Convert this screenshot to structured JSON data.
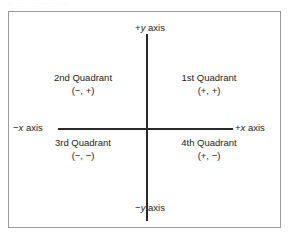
{
  "caption_strip": {
    "text": "·· ··· ·· ····· ···· ···"
  },
  "figure": {
    "border_color": "#9a9a9a",
    "axis_color": "#2a2a2a",
    "text_color": "#1d1d1d",
    "background": "#ffffff"
  },
  "axes": {
    "positive_y": {
      "sign": "+",
      "variable": "y",
      "suffix": " axis"
    },
    "negative_y": {
      "sign": "−",
      "variable": "y",
      "suffix": " axis"
    },
    "positive_x": {
      "sign": "+",
      "variable": "x",
      "suffix": " axis"
    },
    "negative_x": {
      "sign": "−",
      "variable": "x",
      "suffix": " axis"
    }
  },
  "quadrants": [
    {
      "id": 1,
      "name": "1st Quadrant",
      "signs": "(+, +)"
    },
    {
      "id": 2,
      "name": "2nd Quadrant",
      "signs": "(−, +)"
    },
    {
      "id": 3,
      "name": "3rd Quadrant",
      "signs": "(−, −)"
    },
    {
      "id": 4,
      "name": "4th Quadrant",
      "signs": "(+, −)"
    }
  ],
  "chart_data": {
    "type": "scatter",
    "xlabel": "x axis",
    "ylabel": "y axis",
    "xlim": [
      -1,
      1
    ],
    "ylim": [
      -1,
      1
    ],
    "grid": false,
    "legend": "none",
    "annotations": [
      {
        "text": "+y axis",
        "x": 0,
        "y": 1
      },
      {
        "text": "−y axis",
        "x": 0,
        "y": -1
      },
      {
        "text": "+x axis",
        "x": 1,
        "y": 0
      },
      {
        "text": "−x axis",
        "x": -1,
        "y": 0
      },
      {
        "text": "1st Quadrant (+, +)",
        "x": 0.5,
        "y": 0.5
      },
      {
        "text": "2nd Quadrant (−, +)",
        "x": -0.5,
        "y": 0.5
      },
      {
        "text": "3rd Quadrant (−, −)",
        "x": -0.5,
        "y": -0.5
      },
      {
        "text": "4th Quadrant (+, −)",
        "x": 0.5,
        "y": -0.5
      }
    ],
    "series": []
  }
}
